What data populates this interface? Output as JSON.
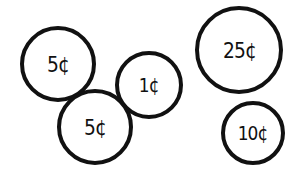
{
  "colors": {
    "stroke": "#111111",
    "fill": "#ffffff",
    "background": "#ffffff"
  },
  "coins": [
    {
      "label": "5¢",
      "value_cents": 5,
      "cx": 58,
      "cy": 64,
      "r": 38,
      "font_size": 22
    },
    {
      "label": "1¢",
      "value_cents": 1,
      "cx": 149,
      "cy": 85,
      "r": 34,
      "font_size": 20
    },
    {
      "label": "5¢",
      "value_cents": 5,
      "cx": 95,
      "cy": 127,
      "r": 38,
      "font_size": 22
    },
    {
      "label": "25¢",
      "value_cents": 25,
      "cx": 239,
      "cy": 50,
      "r": 44,
      "font_size": 22
    },
    {
      "label": "10¢",
      "value_cents": 10,
      "cx": 253,
      "cy": 133,
      "r": 32,
      "font_size": 20
    }
  ]
}
